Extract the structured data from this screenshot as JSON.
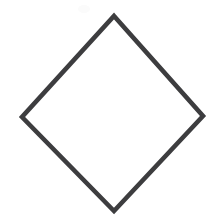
{
  "canvas": {
    "width": 211,
    "height": 215,
    "background_color": "#ffffff",
    "description": "Blank white page containing a single hand-drawn diamond outline"
  },
  "figure": {
    "name": "diamond",
    "alt_names": [
      "rhombus",
      "rotated square"
    ],
    "shape_type": "quadrilateral",
    "fill": "none",
    "fill_color": "#ffffff",
    "stroke_color": "#3d3d3f",
    "stroke_width": 4.6,
    "stroke_linejoin": "miter",
    "closed": true,
    "vertices": [
      {
        "label": "top",
        "x": 114,
        "y": 16
      },
      {
        "label": "right",
        "x": 203,
        "y": 116
      },
      {
        "label": "bottom",
        "x": 114,
        "y": 211
      },
      {
        "label": "left",
        "x": 22,
        "y": 117
      }
    ],
    "points_attr": "114,16 203,116 114,211 22,117",
    "bounding_box": {
      "x": 22,
      "y": 16,
      "width": 181,
      "height": 195
    },
    "center": {
      "x": 114,
      "y": 115
    },
    "diagonal_horizontal_px": 181,
    "diagonal_vertical_px": 195
  },
  "artifacts": [
    {
      "name": "scan-smudge",
      "description": "Faint near-white smudge from scanning, upper-left of apex",
      "x": 78,
      "y": 5,
      "width": 12,
      "height": 8,
      "color": "#fbfbfb"
    }
  ]
}
